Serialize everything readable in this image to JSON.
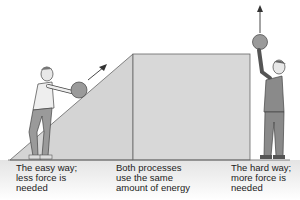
{
  "figure": {
    "captions": {
      "left": [
        "The easy way;",
        "less force is",
        "needed"
      ],
      "middle": [
        "Both processes",
        "use the same",
        "amount of energy"
      ],
      "right": [
        "The hard way;",
        "more force is",
        "needed"
      ]
    },
    "elements": {
      "ramp": "inclined-plane",
      "block": "raised-platform",
      "left_figure": "person-pushing-ball-up-ramp",
      "right_figure": "person-lifting-ball-overhead",
      "left_arrow_direction": "up-ramp",
      "right_arrow_direction": "straight-up"
    },
    "colors": {
      "surface": "#d6d6d6",
      "surface_dark": "#bdbdbd",
      "outline": "#555555",
      "ball": "#9a9a9a",
      "ground": "#e4e4e4"
    }
  }
}
